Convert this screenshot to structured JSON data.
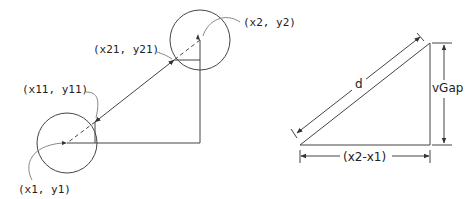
{
  "left_diagram": {
    "labels": {
      "p2": "(x2, y2)",
      "p21": "(x21, y21)",
      "p11": "(x11, y11)",
      "p1": "(x1, y1)"
    },
    "circles": [
      {
        "name": "start-circle",
        "cx": 67,
        "cy": 143,
        "r": 30
      },
      {
        "name": "end-circle",
        "cx": 200,
        "cy": 40,
        "r": 30
      }
    ]
  },
  "right_diagram": {
    "labels": {
      "hypotenuse": "d",
      "vertical": "vGap",
      "horizontal": "(x2-x1)"
    }
  },
  "colors": {
    "stroke": "#444444",
    "leader": "#888888",
    "text": "#222222"
  }
}
